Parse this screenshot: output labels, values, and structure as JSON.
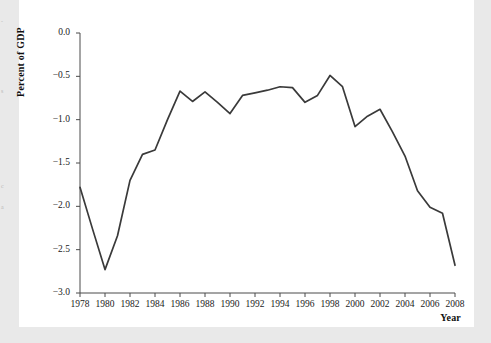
{
  "page": {
    "background_color": "#e9e9e9",
    "sheet_color": "#ffffff",
    "margin_fragments": [
      {
        "text": "-",
        "top": 18
      },
      {
        "text": "s",
        "top": 88
      },
      {
        "text": "c",
        "top": 183
      },
      {
        "text": "a",
        "top": 204
      }
    ]
  },
  "chart_data": {
    "type": "line",
    "title": "",
    "xlabel": "Year",
    "ylabel": "Percent of GDP",
    "xlim": [
      1978,
      2008
    ],
    "ylim": [
      -3.0,
      0.0
    ],
    "grid": false,
    "legend": "none",
    "line_color": "#3a3a3a",
    "x_tick_labels": [
      "1978",
      "1980",
      "1982",
      "1984",
      "1986",
      "1988",
      "1990",
      "1992",
      "1994",
      "1996",
      "1998",
      "2000",
      "2002",
      "2004",
      "2006",
      "2008"
    ],
    "x_ticks": [
      1978,
      1980,
      1982,
      1984,
      1986,
      1988,
      1990,
      1992,
      1994,
      1996,
      1998,
      2000,
      2002,
      2004,
      2006,
      2008
    ],
    "y_tick_labels": [
      "0.0",
      "−0.5",
      "−1.0",
      "−1.5",
      "−2.0",
      "−2.5",
      "−3.0"
    ],
    "y_ticks": [
      0.0,
      -0.5,
      -1.0,
      -1.5,
      -2.0,
      -2.5,
      -3.0
    ],
    "series": [
      {
        "name": "Percent of GDP",
        "x": [
          1978,
          1979,
          1980,
          1981,
          1982,
          1983,
          1984,
          1985,
          1986,
          1987,
          1988,
          1989,
          1990,
          1991,
          1992,
          1993,
          1994,
          1995,
          1996,
          1997,
          1998,
          1999,
          2000,
          2001,
          2002,
          2003,
          2004,
          2005,
          2006,
          2007,
          2008
        ],
        "values": [
          -1.78,
          -2.26,
          -2.73,
          -2.34,
          -1.7,
          -1.4,
          -1.35,
          -1.0,
          -0.67,
          -0.79,
          -0.68,
          -0.8,
          -0.93,
          -0.72,
          -0.69,
          -0.66,
          -0.62,
          -0.63,
          -0.8,
          -0.72,
          -0.49,
          -0.62,
          -1.08,
          -0.96,
          -0.88,
          -1.14,
          -1.42,
          -1.82,
          -2.01,
          -2.08,
          -2.68
        ]
      }
    ]
  }
}
